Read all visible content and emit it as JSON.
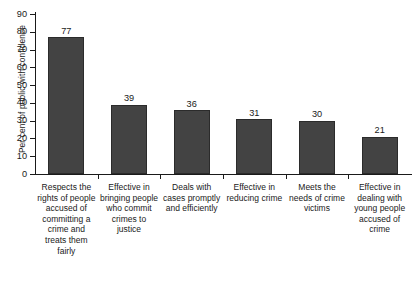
{
  "chart_data": {
    "type": "bar",
    "title": "",
    "subtitle": "",
    "xlabel": "",
    "ylabel": "Per cent of public with confidence",
    "ylim": [
      0,
      90
    ],
    "ytick_step": 10,
    "ytick_labels": [
      "0",
      "10",
      "20",
      "30",
      "40",
      "50",
      "60",
      "70",
      "80",
      "90"
    ],
    "grid": false,
    "legend": "none",
    "bar_color": "#434343",
    "categories": [
      "Respects the rights of people accused of committing a crime and treats them fairly",
      "Effective in bringing people who commit crimes to justice",
      "Deals with cases promptly and efficiently",
      "Effective in reducing crime",
      "Meets the needs of crime victims",
      "Effective in dealing with young people accused of crime"
    ],
    "values": [
      77,
      39,
      36,
      31,
      30,
      21
    ],
    "value_labels": [
      "77",
      "39",
      "36",
      "31",
      "30",
      "21"
    ]
  }
}
